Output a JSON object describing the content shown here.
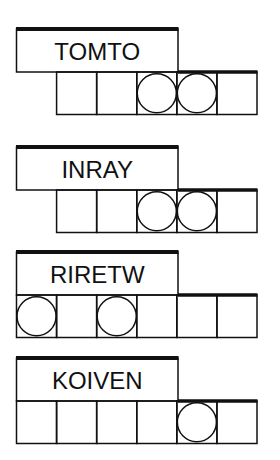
{
  "puzzles": [
    {
      "scrambled": "TOMTO",
      "answer_length": 5,
      "circled_positions": [
        3,
        4
      ]
    },
    {
      "scrambled": "INRAY",
      "answer_length": 5,
      "circled_positions": [
        3,
        4
      ]
    },
    {
      "scrambled": "RIRETW",
      "answer_length": 6,
      "circled_positions": [
        1,
        3
      ]
    },
    {
      "scrambled": "KOIVEN",
      "answer_length": 6,
      "circled_positions": [
        5
      ]
    }
  ],
  "colors": {
    "ink": "#111111",
    "background": "#ffffff"
  }
}
